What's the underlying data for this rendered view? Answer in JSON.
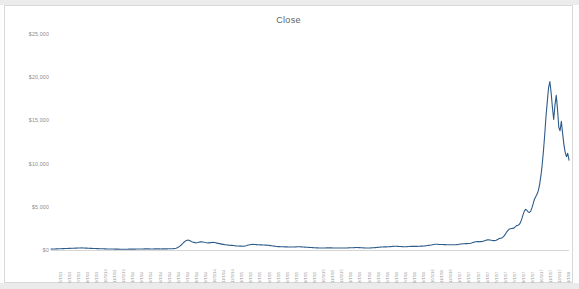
{
  "chart_data": {
    "type": "line",
    "title": "Close",
    "xlabel": "",
    "ylabel": "",
    "ylim": [
      0,
      25000
    ],
    "y_ticks": [
      0,
      5000,
      10000,
      15000,
      20000,
      25000
    ],
    "y_tick_labels": [
      "$0",
      "$5,000",
      "$10,000",
      "$15,000",
      "$20,000",
      "$25,000"
    ],
    "grid": false,
    "legend": "none",
    "line_color": "#2e5c8a",
    "series": [
      {
        "name": "Close",
        "x": [
          "5/1/13",
          "6/1/13",
          "7/1/13",
          "8/1/13",
          "9/1/13",
          "10/1/13",
          "11/1/13",
          "12/1/13",
          "1/1/14",
          "2/1/14",
          "3/1/14",
          "4/1/14",
          "5/1/14",
          "6/1/14",
          "7/1/14",
          "8/1/14",
          "9/1/14",
          "10/1/14",
          "11/1/14",
          "12/1/14",
          "1/1/15",
          "2/1/15",
          "3/1/15",
          "4/1/15",
          "5/1/15",
          "6/1/15",
          "7/1/15",
          "8/1/15",
          "9/1/15",
          "10/1/15",
          "11/1/15",
          "12/1/15",
          "1/1/16",
          "2/1/16",
          "3/1/16",
          "4/1/16",
          "5/1/16",
          "6/1/16",
          "7/1/16",
          "8/1/16",
          "9/1/16",
          "10/1/16",
          "11/1/16",
          "12/1/16",
          "1/1/17",
          "2/1/17",
          "3/1/17",
          "4/1/17",
          "5/1/17",
          "6/1/17",
          "7/1/17",
          "8/1/17",
          "9/1/17",
          "10/1/17",
          "11/1/17",
          "12/1/17",
          "1/1/18"
        ],
        "values": [
          139,
          122,
          90,
          106,
          127,
          127,
          204,
          1100,
          806,
          823,
          565,
          449,
          445,
          630,
          641,
          595,
          477,
          386,
          338,
          378,
          315,
          226,
          254,
          247,
          236,
          223,
          258,
          284,
          230,
          236,
          327,
          362,
          434,
          373,
          424,
          417,
          449,
          535,
          673,
          625,
          609,
          614,
          706,
          745,
          966,
          970,
          1180,
          1080,
          1380,
          2400,
          2500,
          2870,
          4700,
          4340,
          6470,
          9900,
          13400
        ],
        "daily_points": [
          106,
          112,
          119,
          124,
          128,
          135,
          142,
          148,
          152,
          158,
          163,
          168,
          173,
          178,
          184,
          190,
          196,
          202,
          208,
          214,
          220,
          226,
          233,
          240,
          245,
          238,
          230,
          222,
          215,
          208,
          200,
          193,
          186,
          180,
          174,
          168,
          162,
          156,
          150,
          145,
          140,
          136,
          132,
          128,
          124,
          120,
          117,
          114,
          111,
          108,
          105,
          102,
          99,
          96,
          94,
          92,
          90,
          89,
          90,
          92,
          94,
          96,
          98,
          100,
          102,
          104,
          106,
          108,
          110,
          113,
          116,
          119,
          122,
          125,
          128,
          130,
          128,
          126,
          124,
          122,
          124,
          126,
          128,
          127,
          126,
          125,
          124,
          126,
          128,
          130,
          132,
          134,
          136,
          138,
          140,
          145,
          155,
          175,
          205,
          260,
          340,
          450,
          580,
          720,
          870,
          1000,
          1090,
          1140,
          1120,
          1060,
          990,
          930,
          880,
          850,
          830,
          860,
          900,
          940,
          960,
          930,
          890,
          860,
          840,
          820,
          830,
          850,
          870,
          880,
          860,
          830,
          800,
          770,
          740,
          710,
          680,
          650,
          620,
          600,
          580,
          565,
          550,
          540,
          530,
          520,
          500,
          480,
          465,
          455,
          450,
          445,
          440,
          450,
          470,
          500,
          540,
          580,
          610,
          640,
          650,
          640,
          630,
          620,
          610,
          600,
          595,
          590,
          585,
          580,
          570,
          560,
          545,
          530,
          510,
          490,
          470,
          450,
          430,
          410,
          395,
          385,
          378,
          372,
          368,
          364,
          360,
          356,
          352,
          348,
          344,
          340,
          345,
          355,
          365,
          375,
          378,
          372,
          365,
          355,
          345,
          335,
          325,
          315,
          305,
          295,
          285,
          275,
          265,
          255,
          248,
          242,
          238,
          235,
          232,
          230,
          234,
          240,
          248,
          254,
          250,
          246,
          242,
          240,
          238,
          236,
          234,
          232,
          230,
          228,
          226,
          224,
          226,
          230,
          236,
          244,
          252,
          258,
          262,
          268,
          275,
          282,
          284,
          280,
          272,
          262,
          252,
          242,
          234,
          230,
          232,
          236,
          240,
          245,
          252,
          262,
          275,
          290,
          305,
          320,
          330,
          340,
          350,
          358,
          362,
          366,
          372,
          380,
          392,
          405,
          418,
          428,
          434,
          428,
          420,
          410,
          398,
          386,
          376,
          373,
          378,
          388,
          400,
          412,
          420,
          424,
          420,
          418,
          417,
          420,
          428,
          436,
          444,
          449,
          460,
          478,
          500,
          520,
          535,
          550,
          575,
          610,
          645,
          665,
          673,
          665,
          650,
          640,
          632,
          628,
          625,
          620,
          615,
          612,
          610,
          609,
          608,
          610,
          612,
          614,
          620,
          640,
          670,
          700,
          706,
          715,
          725,
          735,
          742,
          745,
          760,
          790,
          830,
          880,
          920,
          950,
          966,
          980,
          975,
          970,
          990,
          1030,
          1080,
          1130,
          1170,
          1180,
          1160,
          1130,
          1100,
          1080,
          1090,
          1140,
          1220,
          1300,
          1360,
          1380,
          1450,
          1600,
          1800,
          2050,
          2250,
          2400,
          2450,
          2480,
          2500,
          2560,
          2700,
          2820,
          2870,
          2950,
          3200,
          3600,
          4100,
          4500,
          4700,
          4600,
          4400,
          4340,
          4500,
          4900,
          5400,
          5900,
          6200,
          6470,
          6900,
          7600,
          8600,
          9900,
          11500,
          13400,
          15500,
          17200,
          18800,
          19497,
          18200,
          16500,
          15100,
          16800,
          17900,
          16300,
          14200,
          13800,
          14900,
          13500,
          12200,
          11300,
          10800,
          11200,
          10400
        ]
      }
    ]
  },
  "title": "Close"
}
